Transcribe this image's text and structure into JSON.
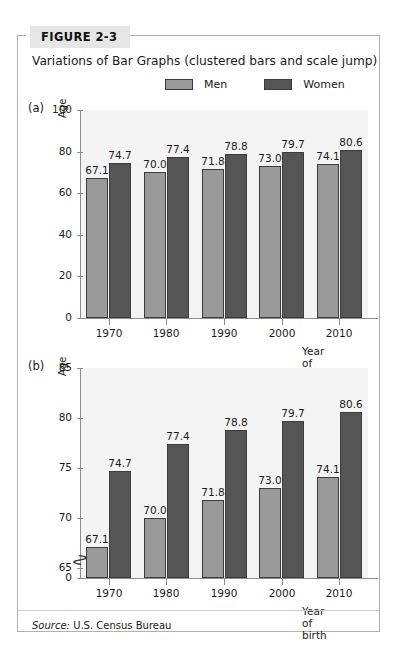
{
  "figure": {
    "tab_label": "FIGURE 2-3",
    "caption": "Variations of Bar Graphs (clustered bars and scale jump)",
    "source_prefix": "Source:",
    "source_text": "U.S. Census Bureau"
  },
  "legend": {
    "items": [
      {
        "label": "Men",
        "color": "#9a9a9a",
        "icon": "legend-swatch-men"
      },
      {
        "label": "Women",
        "color": "#555555",
        "icon": "legend-swatch-women"
      }
    ]
  },
  "panels": [
    {
      "letter": "(a)"
    },
    {
      "letter": "(b)"
    }
  ],
  "chart_data": [
    {
      "type": "bar",
      "panel": "(a)",
      "title": "",
      "xlabel": "Year of birth",
      "ylabel": "Age",
      "categories": [
        "1970",
        "1980",
        "1990",
        "2000",
        "2010"
      ],
      "series": [
        {
          "name": "Men",
          "color": "#9a9a9a",
          "values": [
            67.1,
            70.0,
            71.8,
            73.0,
            74.1
          ]
        },
        {
          "name": "Women",
          "color": "#555555",
          "values": [
            74.7,
            77.4,
            78.8,
            79.7,
            80.6
          ]
        }
      ],
      "yticks": [
        0,
        20,
        40,
        60,
        80,
        100
      ],
      "ylim": [
        0,
        100
      ],
      "axis_break": false,
      "grid": false,
      "legend_position": "top-right",
      "data_labels": true
    },
    {
      "type": "bar",
      "panel": "(b)",
      "title": "",
      "xlabel": "Year of birth",
      "ylabel": "Age",
      "categories": [
        "1970",
        "1980",
        "1990",
        "2000",
        "2010"
      ],
      "series": [
        {
          "name": "Men",
          "color": "#9a9a9a",
          "values": [
            67.1,
            70.0,
            71.8,
            73.0,
            74.1
          ]
        },
        {
          "name": "Women",
          "color": "#555555",
          "values": [
            74.7,
            77.4,
            78.8,
            79.7,
            80.6
          ]
        }
      ],
      "yticks": [
        0,
        65,
        70,
        75,
        80,
        85
      ],
      "ylim": [
        64,
        85
      ],
      "axis_break": true,
      "axis_break_glyph": "scale-jump",
      "grid": false,
      "legend_position": "top-right",
      "data_labels": true
    }
  ]
}
